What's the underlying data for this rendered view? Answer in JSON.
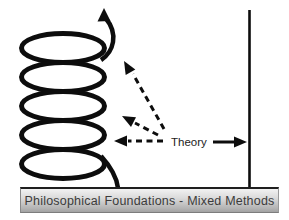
{
  "diagram": {
    "theory_label": "Theory",
    "caption": "Philosophical Foundations - Mixed Methods",
    "colors": {
      "stroke": "#0d0d0d",
      "background": "#ffffff",
      "caption_text": "#3b3b3b",
      "caption_gradient_top": "#f2f2f2",
      "caption_gradient_bottom": "#a2a2a2",
      "caption_border_top": "#1f1f1f"
    }
  }
}
